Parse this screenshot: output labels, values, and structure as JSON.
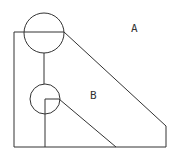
{
  "diagram": {
    "labels": {
      "a": "A",
      "b": "B"
    },
    "stroke_color": "#333333",
    "background": "#ffffff"
  }
}
